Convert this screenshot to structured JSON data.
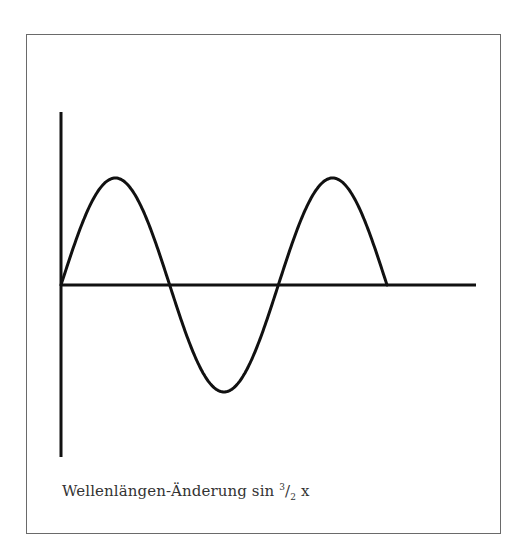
{
  "figure": {
    "caption_prefix": "Wellenlängen-Änderung sin",
    "caption_frac_num": "3",
    "caption_frac_slash": "/",
    "caption_frac_den": "2",
    "caption_var": "x",
    "caption_full": "Wellenlängen-Änderung sin 3/2 x",
    "line_color": "#111111",
    "frame_color": "#6a6a6a",
    "curve": {
      "function": "sin(3/2 x)",
      "description": "Sine wave starting at origin, rising to a peak, dipping to a trough, rising to a second peak and ending on the x-axis",
      "points": [
        {
          "label": "start",
          "x": 61,
          "y": 285
        },
        {
          "label": "peak-1",
          "x": 116,
          "y": 178
        },
        {
          "label": "zero-1",
          "x": 168,
          "y": 285
        },
        {
          "label": "trough",
          "x": 226,
          "y": 392
        },
        {
          "label": "zero-2",
          "x": 280,
          "y": 285
        },
        {
          "label": "peak-2",
          "x": 333,
          "y": 178
        },
        {
          "label": "end",
          "x": 387,
          "y": 285
        }
      ]
    },
    "axes": {
      "y_axis": {
        "x": 61,
        "y_top": 112,
        "y_bottom": 457
      },
      "x_axis": {
        "y": 285,
        "x_left": 61,
        "x_right": 476
      }
    }
  }
}
